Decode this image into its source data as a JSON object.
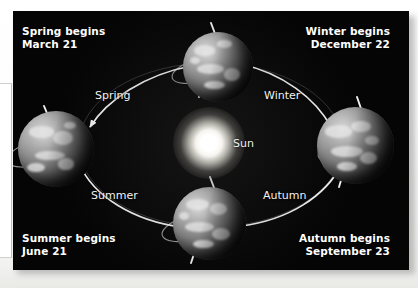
{
  "figure": {
    "background_color": "#050505",
    "text_color": "#ffffff",
    "sun": {
      "label": "Sun",
      "color": "#ffffff"
    },
    "corner_labels": [
      {
        "id": "spring",
        "line1": "Spring begins",
        "line2": "March 21"
      },
      {
        "id": "winter",
        "line1": "Winter begins",
        "line2": "December 22"
      },
      {
        "id": "summer",
        "line1": "Summer begins",
        "line2": "June 21"
      },
      {
        "id": "autumn",
        "line1": "Autumn begins",
        "line2": "September 23"
      }
    ],
    "season_labels": [
      {
        "id": "spring",
        "text": "Spring"
      },
      {
        "id": "winter",
        "text": "Winter"
      },
      {
        "id": "summer",
        "text": "Summer"
      },
      {
        "id": "autumn",
        "text": "Autumn"
      }
    ],
    "orbit": {
      "shape": "ellipse",
      "direction": "counter-clockwise",
      "stroke_color": "#f0f0f0",
      "arrow_count": 4
    },
    "earth_positions": [
      {
        "id": "top",
        "season_start": "Spring begins",
        "date": "March 21"
      },
      {
        "id": "right",
        "season_start": "Winter begins",
        "date": "December 22"
      },
      {
        "id": "bottom",
        "season_start": "Autumn begins",
        "date": "September 23"
      },
      {
        "id": "left",
        "season_start": "Summer begins",
        "date": "June 21"
      }
    ]
  }
}
